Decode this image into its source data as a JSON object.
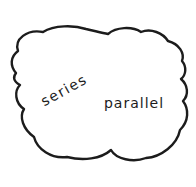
{
  "diagram": {
    "type": "hand-drawn-cloud",
    "ink_color": "#1c1c1c",
    "background_color": "#ffffff",
    "labels": {
      "series": "series",
      "parallel": "parallel"
    }
  }
}
